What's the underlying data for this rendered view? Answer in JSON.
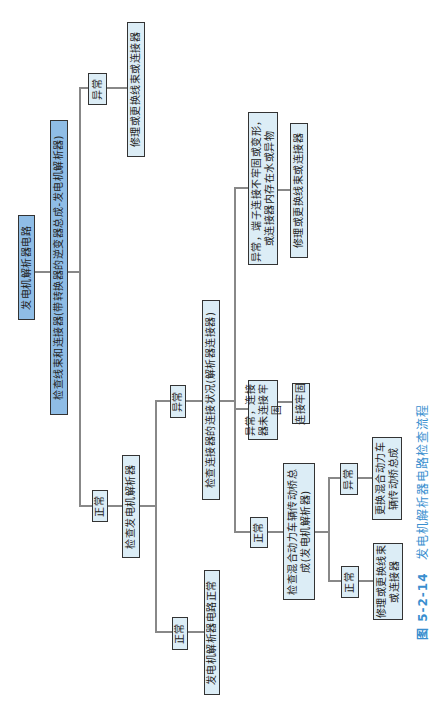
{
  "diagram": {
    "root": "发电机解析器电路",
    "check_harness": "检查线束和连接器(带转换器的逆变器总成-发电机解析器)",
    "harness_abnormal": "异常",
    "harness_abnormal_action": "修理或更换线束或连接器",
    "harness_normal": "正常",
    "check_resolver": "检查发电机解析器",
    "resolver_normal": "正常",
    "resolver_normal_result": "发电机解析器电路正常",
    "resolver_abnormal": "异常",
    "check_connector": "检查连接器的连接状况(解析器连接器)",
    "connector_normal": "正常",
    "check_transaxle": "检查混合动力车辆传动桥总成(发电机解析器)",
    "transaxle_normal": "正常",
    "transaxle_normal_action": "修理或更换线束或连接器",
    "transaxle_abnormal": "异常",
    "transaxle_abnormal_action": "更换混合动力车辆传动桥总成",
    "connector_loose": "异常，连接器未连接牢固",
    "connector_loose_action": "连接牢固",
    "terminal_issue": "异常，端子连接不牢固或变形，或连接器内存在水或异物",
    "terminal_issue_action": "修理或更换线束或连接器"
  },
  "caption": {
    "number": "图 5-2-14",
    "title": "发电机解析器电路检查流程"
  }
}
